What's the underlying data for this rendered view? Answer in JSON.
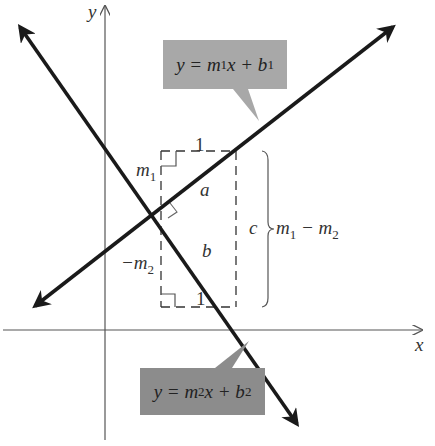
{
  "diagram": {
    "axes": {
      "x_label": "x",
      "y_label": "y"
    },
    "line1": {
      "equation": {
        "lhs": "y = m",
        "sub1": "1",
        "mid": "x + b",
        "sub2": "1"
      },
      "slope_label": "m",
      "slope_sub": "1",
      "segment_label": "a"
    },
    "line2": {
      "equation": {
        "lhs": "y = m",
        "sub1": "2",
        "mid": "x + b",
        "sub2": "2"
      },
      "slope_label": "−m",
      "slope_sub": "2",
      "segment_label": "b"
    },
    "rise_top_label": "1",
    "rise_bottom_label": "1",
    "hypotenuse_label": "c",
    "brace_label": {
      "m1": "m",
      "sub1": "1",
      "minus": " − m",
      "sub2": "2"
    },
    "colors": {
      "line": "#1a1a1a",
      "axis": "#555555",
      "callout_top": "#a8a8a8",
      "callout_bottom": "#8c8c8c",
      "dash": "#333333"
    }
  }
}
